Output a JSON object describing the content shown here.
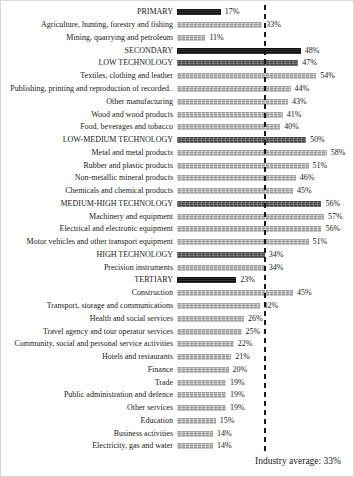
{
  "chart_data": {
    "type": "bar",
    "orientation": "horizontal",
    "unit": "%",
    "xlim": [
      0,
      62
    ],
    "grid": false,
    "legend_position": "none",
    "annotation": "Industry average: 33%",
    "industry_average": 33,
    "colors": {
      "sector_bar": "#161616",
      "tech_bar": "#5a5a5a",
      "item_bar": "#a6a6a6",
      "average_line": "#1a1a1a"
    },
    "rows": [
      {
        "label": "PRIMARY",
        "value": 17,
        "style": "sector"
      },
      {
        "label": "Agriculture, hunting, forestry and fishing",
        "value": 33,
        "style": "item"
      },
      {
        "label": "Mining, quarrying and petroleum",
        "value": 11,
        "style": "item"
      },
      {
        "label": "SECONDARY",
        "value": 48,
        "style": "sector"
      },
      {
        "label": "LOW TECHNOLOGY",
        "value": 47,
        "style": "tech"
      },
      {
        "label": "Textiles, clothing and leather",
        "value": 54,
        "style": "item"
      },
      {
        "label": "Publishing,  printing and reproduction of recorded..",
        "value": 44,
        "style": "item"
      },
      {
        "label": "Other manufacturing",
        "value": 43,
        "style": "item"
      },
      {
        "label": "Wood and wood products",
        "value": 41,
        "style": "item"
      },
      {
        "label": "Food, beverages and tobacco",
        "value": 40,
        "style": "item"
      },
      {
        "label": "LOW-MEDIUM TECHNOLOGY",
        "value": 50,
        "style": "tech"
      },
      {
        "label": "Metal and metal products",
        "value": 58,
        "style": "item"
      },
      {
        "label": "Rubber and plastic products",
        "value": 51,
        "style": "item"
      },
      {
        "label": "Non-metallic mineral products",
        "value": 46,
        "style": "item"
      },
      {
        "label": "Chemicals and chemical products",
        "value": 45,
        "style": "item"
      },
      {
        "label": "MEDIUM-HIGH TECHNOLOGY",
        "value": 56,
        "style": "tech"
      },
      {
        "label": "Machinery and equipment",
        "value": 57,
        "style": "item"
      },
      {
        "label": "Electrical and electronic equipment",
        "value": 56,
        "style": "item"
      },
      {
        "label": "Motor vehicles and other transport equipment",
        "value": 51,
        "style": "item"
      },
      {
        "label": "HIGH TECHNOLOGY",
        "value": 34,
        "style": "tech"
      },
      {
        "label": "Precision instruments",
        "value": 34,
        "style": "item"
      },
      {
        "label": "TERTIARY",
        "value": 23,
        "style": "sector"
      },
      {
        "label": "Construction",
        "value": 45,
        "style": "item"
      },
      {
        "label": "Transport, storage and communications",
        "value": 32,
        "style": "item"
      },
      {
        "label": "Health and social services",
        "value": 26,
        "style": "item"
      },
      {
        "label": "Travel agency and tour operator services",
        "value": 25,
        "style": "item"
      },
      {
        "label": "Community, social and personal service activities",
        "value": 22,
        "style": "item"
      },
      {
        "label": "Hotels and restaurants",
        "value": 21,
        "style": "item"
      },
      {
        "label": "Finance",
        "value": 20,
        "style": "item"
      },
      {
        "label": "Trade",
        "value": 19,
        "style": "item"
      },
      {
        "label": "Public administration and defence",
        "value": 19,
        "style": "item"
      },
      {
        "label": "Other services",
        "value": 19,
        "style": "item"
      },
      {
        "label": "Education",
        "value": 15,
        "style": "item"
      },
      {
        "label": "Business activities",
        "value": 14,
        "style": "item"
      },
      {
        "label": "Electricity, gas and water",
        "value": 14,
        "style": "item"
      }
    ]
  }
}
